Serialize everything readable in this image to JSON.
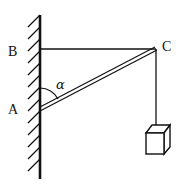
{
  "diagram": {
    "labels": {
      "B": "B",
      "C": "C",
      "A": "A",
      "angle": "α"
    },
    "elements": {
      "wall": "hatched vertical wall",
      "cable_bc": "horizontal cable from B to C",
      "rod_ac": "rod (double line) from A to C",
      "string": "vertical string from C to load",
      "load": "box-shaped weight"
    },
    "colors": {
      "ink": "#111111",
      "background": "#ffffff"
    }
  }
}
